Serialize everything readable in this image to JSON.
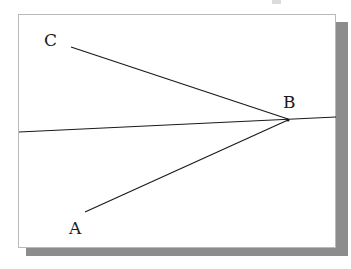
{
  "figure": {
    "kind": "geometry-diagram",
    "panel": {
      "background_color": "#ffffff",
      "border_color": "#b9b9b9",
      "shadow_color": "#8c8c8c"
    },
    "stroke_color": "#1a1a1a",
    "labels": [
      {
        "text": "C",
        "name": "point-label-c"
      },
      {
        "text": "B",
        "name": "point-label-b"
      },
      {
        "text": "A",
        "name": "point-label-a"
      }
    ],
    "segments": [
      {
        "name": "ray-c-to-b",
        "from": "C",
        "to": "B",
        "x1": 71,
        "y1": 47,
        "x2": 288,
        "y2": 119
      },
      {
        "name": "ray-a-to-b",
        "from": "A",
        "to": "B",
        "x1": 85,
        "y1": 212,
        "x2": 288,
        "y2": 120
      },
      {
        "name": "horizontal-line-through-b",
        "from": "left-edge",
        "to": "right-edge",
        "x1": 19,
        "y1": 132,
        "x2": 336,
        "y2": 117
      }
    ]
  }
}
